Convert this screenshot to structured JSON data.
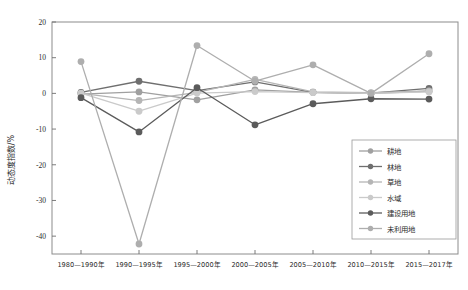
{
  "chart_data": {
    "type": "line",
    "title": "",
    "xlabel": "",
    "ylabel": "动态度指数/%",
    "ylim": [
      -45,
      20
    ],
    "yticks": [
      20,
      10,
      0,
      -10,
      -20,
      -30,
      -40
    ],
    "ytick_labels": [
      "20",
      "10",
      "0",
      "-10",
      "-20",
      "-30",
      "-40"
    ],
    "grid": false,
    "legend_position": "right-bottom",
    "categories": [
      "1980—1990年",
      "1990—1995年",
      "1995—2000年",
      "2000—2005年",
      "2005—2010年",
      "2010—2015年",
      "2015—2017年"
    ],
    "series": [
      {
        "name": "耕地",
        "marker": "circle",
        "color": "#a0a0a0",
        "values": [
          -0.2,
          0.4,
          -1.8,
          1.0,
          0.3,
          0.0,
          0.6
        ]
      },
      {
        "name": "林地",
        "marker": "circle",
        "color": "#6f6f6f",
        "values": [
          0.3,
          3.4,
          0.8,
          3.2,
          0.3,
          0.1,
          1.4
        ]
      },
      {
        "name": "草地",
        "marker": "circle",
        "color": "#b5b5b5",
        "values": [
          0.0,
          -2.0,
          0.3,
          3.9,
          0.4,
          0.2,
          0.7
        ]
      },
      {
        "name": "水域",
        "marker": "circle",
        "color": "#cacaca",
        "values": [
          0.1,
          -5.0,
          0.1,
          0.5,
          0.2,
          0.0,
          0.4
        ]
      },
      {
        "name": "建设用地",
        "marker": "circle",
        "color": "#5b5b5b",
        "values": [
          -1.2,
          -10.8,
          1.6,
          -8.8,
          -2.9,
          -1.5,
          -1.6
        ]
      },
      {
        "name": "未利用地",
        "marker": "circle",
        "color": "#aeaeae",
        "values": [
          8.9,
          -42.2,
          13.4,
          3.4,
          8.0,
          0.0,
          11.1
        ]
      }
    ]
  },
  "axis": {
    "y_title": "动态度指数/%"
  },
  "legend": {
    "items": [
      {
        "label": "耕地"
      },
      {
        "label": "林地"
      },
      {
        "label": "草地"
      },
      {
        "label": "水域"
      },
      {
        "label": "建设用地"
      },
      {
        "label": "未利用地"
      }
    ]
  }
}
